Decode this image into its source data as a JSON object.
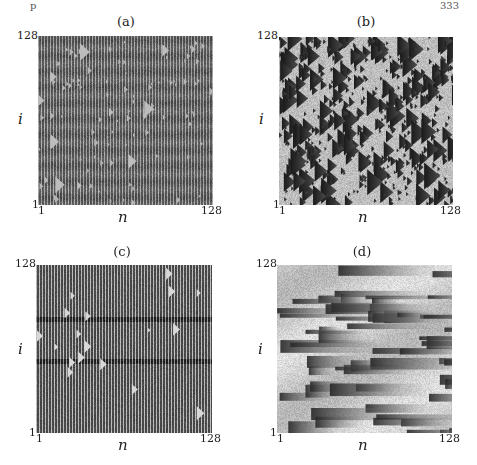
{
  "page": {
    "header_left": "p",
    "header_right": "333"
  },
  "chart_data": [
    {
      "type": "heatmap",
      "title": "(a)",
      "xlabel": "n",
      "ylabel": "i",
      "x_ticks": [
        "1",
        "128"
      ],
      "y_ticks": [
        "1",
        "128"
      ],
      "xlim": [
        1,
        128
      ],
      "ylim": [
        1,
        128
      ],
      "pattern": "dense vertical stripes with small light triangles",
      "colormap": "grayscale"
    },
    {
      "type": "heatmap",
      "title": "(b)",
      "xlabel": "n",
      "ylabel": "i",
      "x_ticks": [
        "1",
        "128"
      ],
      "y_ticks": [
        "1",
        "128"
      ],
      "xlim": [
        1,
        128
      ],
      "ylim": [
        1,
        128
      ],
      "pattern": "dark triangles of many sizes separated by light borders",
      "colormap": "grayscale"
    },
    {
      "type": "heatmap",
      "title": "(c)",
      "xlabel": "n",
      "ylabel": "i",
      "x_ticks": [
        "1",
        "128"
      ],
      "y_ticks": [
        "1",
        "128"
      ],
      "xlim": [
        1,
        128
      ],
      "ylim": [
        1,
        128
      ],
      "pattern": "regular vertical stripes with sparse light triangles and dark horizontal bands",
      "colormap": "grayscale"
    },
    {
      "type": "heatmap",
      "title": "(d)",
      "xlabel": "n",
      "ylabel": "i",
      "x_ticks": [
        "1",
        "128"
      ],
      "y_ticks": [
        "1",
        "128"
      ],
      "xlim": [
        1,
        128
      ],
      "ylim": [
        1,
        128
      ],
      "pattern": "light gray domains with dark horizontal streaks growing rightward",
      "colormap": "grayscale"
    }
  ]
}
